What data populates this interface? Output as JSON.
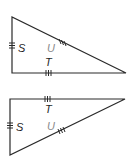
{
  "figures": [
    {
      "name": "triangle-1",
      "labels": {
        "side_vertical": "S",
        "side_horizontal": "T",
        "hypotenuse": "U"
      },
      "orientation": "right-angle-bottom-left"
    },
    {
      "name": "triangle-2",
      "labels": {
        "side_vertical": "S",
        "side_horizontal": "T",
        "hypotenuse": "U"
      },
      "orientation": "right-angle-top-left"
    }
  ],
  "colors": {
    "line": "#2a2a2a",
    "label": "#1e1e1e",
    "hypotenuse_label": "#8a8a8a"
  }
}
